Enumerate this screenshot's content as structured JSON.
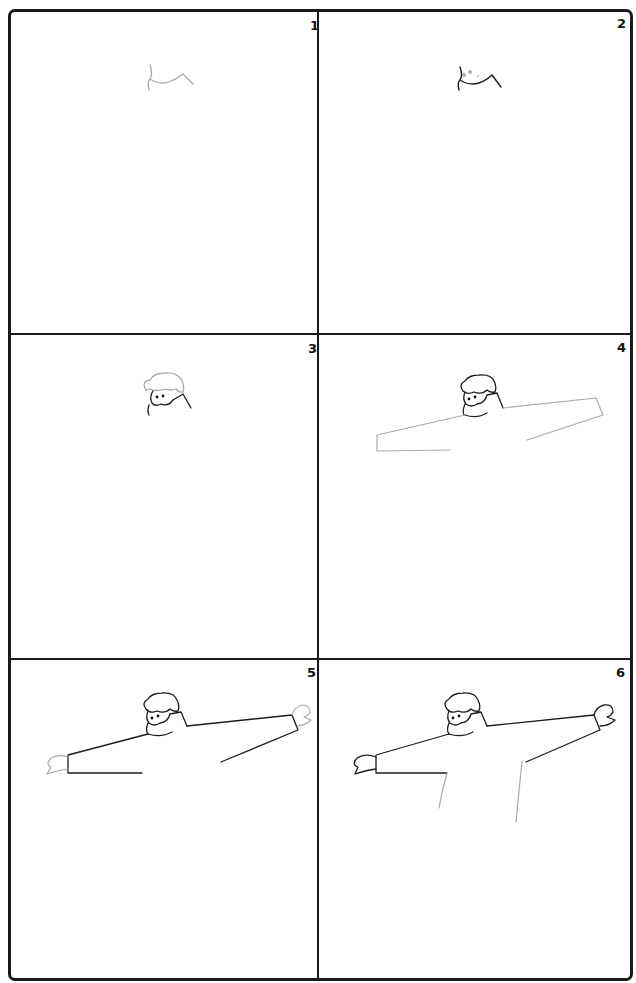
{
  "tutorial": {
    "subject": "how to draw a person with outstretched arms",
    "layout": "3 rows x 2 columns",
    "colors": {
      "frame": "#1a1a1a",
      "new_stroke": "#a9a9a9",
      "previous_stroke": "#1c1c1c",
      "background": "#ffffff"
    },
    "panels": [
      {
        "step": "1",
        "description": "Draw the collar/shoulder outline"
      },
      {
        "step": "2",
        "description": "Add face detail marks and darken the collar"
      },
      {
        "step": "3",
        "description": "Draw the hair and face"
      },
      {
        "step": "4",
        "description": "Draw the long outstretched arms"
      },
      {
        "step": "5",
        "description": "Add mittens on both hands"
      },
      {
        "step": "6",
        "description": "Draw the body sides"
      }
    ]
  }
}
